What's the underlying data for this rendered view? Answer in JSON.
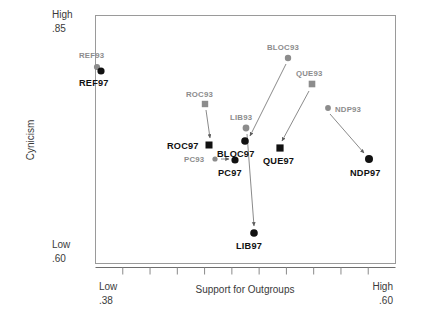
{
  "chart_data": {
    "type": "scatter",
    "title": "",
    "xlabel": "Support for Outgroups",
    "ylabel": "Cynicism",
    "xlim": [
      0.38,
      0.6
    ],
    "ylim": [
      0.6,
      0.85
    ],
    "x_axis": {
      "low_word": "Low",
      "low_value": ".38",
      "high_word": "High",
      "high_value": ".60",
      "tick_count": 10,
      "grid": false
    },
    "y_axis": {
      "low_word": "Low",
      "low_value": ".60",
      "high_word": "High",
      "high_value": ".85",
      "grid": false
    },
    "legend": null,
    "marker_shapes": {
      "circle": "federal/national parties",
      "square": "provincial parties"
    },
    "colors": {
      "year93": "#8c8c8c",
      "year97": "#111111",
      "frame": "#9a9a9a",
      "arrow": "#7d7d7d"
    },
    "points": [
      {
        "label": "REF93",
        "year": 1993,
        "shape": "circle",
        "x": 0.4245,
        "y": 0.8075,
        "px": 97,
        "py": 67,
        "r": 3.1,
        "label_dx": -18,
        "label_dy": -9,
        "label_class": "lbl-93"
      },
      {
        "label": "REF97",
        "year": 1997,
        "shape": "circle",
        "x": 0.4275,
        "y": 0.803,
        "px": 101,
        "py": 71,
        "r": 3.6,
        "label_dx": -22,
        "label_dy": 15,
        "label_class": "lbl-97"
      },
      {
        "label": "ROC93",
        "year": 1993,
        "shape": "square",
        "x": 0.4535,
        "y": 0.7625,
        "px": 205,
        "py": 104,
        "r": 3.2,
        "label_dx": -19,
        "label_dy": -7,
        "label_class": "lbl-93"
      },
      {
        "label": "ROC97",
        "year": 1997,
        "shape": "square",
        "x": 0.4555,
        "y": 0.7405,
        "px": 209,
        "py": 145,
        "r": 3.5,
        "label_dx": -42,
        "label_dy": 4,
        "label_class": "lbl-97"
      },
      {
        "label": "PC93",
        "year": 1993,
        "shape": "circle",
        "x": 0.453,
        "y": 0.7325,
        "px": 215,
        "py": 159,
        "r": 2.6,
        "label_dx": -31,
        "label_dy": 3,
        "label_class": "lbl-93"
      },
      {
        "label": "PC97",
        "year": 1997,
        "shape": "circle",
        "x": 0.4655,
        "y": 0.7305,
        "px": 235,
        "py": 160,
        "r": 3.6,
        "label_dx": -17,
        "label_dy": 16,
        "label_class": "lbl-97"
      },
      {
        "label": "LIB93",
        "year": 1993,
        "shape": "circle",
        "x": 0.4735,
        "y": 0.7525,
        "px": 246,
        "py": 128,
        "r": 3.4,
        "label_dx": -16,
        "label_dy": -8,
        "label_class": "lbl-93"
      },
      {
        "label": "BLOC97",
        "year": 1997,
        "shape": "circle",
        "x": 0.473,
        "y": 0.743,
        "px": 245,
        "py": 141,
        "r": 3.8,
        "label_dx": -28,
        "label_dy": 16,
        "label_class": "lbl-97"
      },
      {
        "label": "BLOC93",
        "year": 1993,
        "shape": "circle",
        "x": 0.4935,
        "y": 0.793,
        "px": 288,
        "py": 58,
        "r": 3.2,
        "label_dx": -21,
        "label_dy": -8,
        "label_class": "lbl-93"
      },
      {
        "label": "QUE93",
        "year": 1993,
        "shape": "square",
        "x": 0.5035,
        "y": 0.7755,
        "px": 312,
        "py": 84,
        "r": 3.3,
        "label_dx": -16,
        "label_dy": -8,
        "label_class": "lbl-93"
      },
      {
        "label": "QUE97",
        "year": 1997,
        "shape": "square",
        "x": 0.488,
        "y": 0.7345,
        "px": 280,
        "py": 148,
        "r": 3.6,
        "label_dx": -17,
        "label_dy": 16,
        "label_class": "lbl-97"
      },
      {
        "label": "NDP93",
        "year": 1993,
        "shape": "circle",
        "x": 0.5135,
        "y": 0.761,
        "px": 328,
        "py": 108,
        "r": 2.9,
        "label_dx": 7,
        "label_dy": 4,
        "label_class": "lbl-93"
      },
      {
        "label": "NDP97",
        "year": 1997,
        "shape": "circle",
        "x": 0.548,
        "y": 0.731,
        "px": 369,
        "py": 159,
        "r": 4.0,
        "label_dx": -19,
        "label_dy": 17,
        "label_class": "lbl-97"
      },
      {
        "label": "LIB97",
        "year": 1997,
        "shape": "circle",
        "x": 0.473,
        "y": 0.667,
        "px": 254,
        "py": 233,
        "r": 3.8,
        "label_dx": -18,
        "label_dy": 16,
        "label_class": "lbl-97"
      }
    ],
    "arrows": [
      {
        "from": "ROC93",
        "to": "ROC97",
        "x1": 206,
        "y1": 110,
        "x2": 210,
        "y2": 138
      },
      {
        "from": "PC93",
        "to": "PC97",
        "x1": 221,
        "y1": 159,
        "x2": 229,
        "y2": 159
      },
      {
        "from": "LIB93",
        "to": "LIB97",
        "x1": 247,
        "y1": 134,
        "x2": 254,
        "y2": 226
      },
      {
        "from": "BLOC93",
        "to": "BLOC97",
        "x1": 286,
        "y1": 64,
        "x2": 250,
        "y2": 136
      },
      {
        "from": "QUE93",
        "to": "QUE97",
        "x1": 309,
        "y1": 91,
        "x2": 282,
        "y2": 141
      },
      {
        "from": "NDP93",
        "to": "NDP97",
        "x1": 330,
        "y1": 114,
        "x2": 364,
        "y2": 153
      }
    ]
  }
}
